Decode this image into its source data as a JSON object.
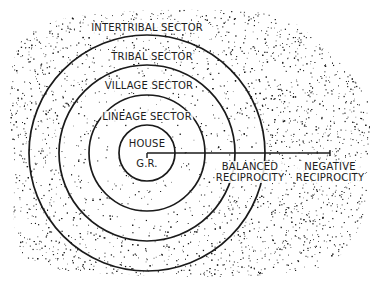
{
  "diagram": {
    "center": {
      "x": 147,
      "y": 153
    },
    "ink_color": "#1a1a1a",
    "background_color": "#ffffff",
    "rings": [
      {
        "name": "house",
        "radius": 28
      },
      {
        "name": "lineage",
        "radius": 58
      },
      {
        "name": "village",
        "radius": 88
      },
      {
        "name": "tribal",
        "radius": 118
      }
    ],
    "sectors": {
      "intertribal": "INTERTRIBAL SECTOR",
      "tribal": "TRIBAL SECTOR",
      "village": "VILLAGE SECTOR",
      "lineage": "LINEAGE SECTOR"
    },
    "center_label": {
      "line1": "HOUSE",
      "line2": "G.R."
    },
    "axis_line": {
      "x1": 147,
      "y1": 153,
      "x2": 330,
      "y2": 153
    },
    "reciprocity_labels": {
      "balanced_line1": "BALANCED",
      "balanced_line2": "RECIPROCITY",
      "negative_line1": "NEGATIVE",
      "negative_line2": "RECIPROCITY"
    }
  }
}
